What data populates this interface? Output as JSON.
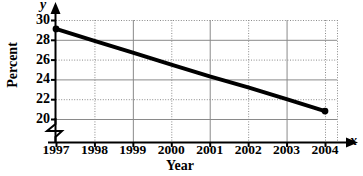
{
  "chart_data": {
    "type": "line",
    "title": "",
    "xlabel": "Year",
    "ylabel": "Percent",
    "x_axis_variable": "x",
    "y_axis_variable": "y",
    "categories": [
      "1997",
      "1998",
      "1999",
      "2000",
      "2001",
      "2002",
      "2003",
      "2004"
    ],
    "x": [
      1997,
      1998,
      1999,
      2000,
      2001,
      2002,
      2003,
      2004
    ],
    "values": [
      29.1,
      27.9,
      26.7,
      25.5,
      24.3,
      23.2,
      22.0,
      20.8
    ],
    "series": [
      {
        "name": "Percent",
        "values": [
          29.1,
          27.9,
          26.7,
          25.5,
          24.3,
          23.2,
          22.0,
          20.8
        ],
        "color": "#000000",
        "marker_endpoints_only": true
      }
    ],
    "ylim": [
      20,
      30
    ],
    "xlim": [
      1997,
      2004
    ],
    "ytick_labels": [
      "30",
      "28",
      "26",
      "24",
      "22",
      "20"
    ],
    "ytick_values": [
      30,
      28,
      26,
      24,
      22,
      20
    ],
    "grid": true,
    "grid_color": "#8a8a8a",
    "legend": false,
    "legend_position": "none",
    "y_axis_break": true,
    "annotations": []
  },
  "axis": {
    "y_variable_glyph": "y",
    "x_variable_glyph": "x",
    "y_title": "Percent",
    "x_title": "Year"
  },
  "colors": {
    "line": "#000000",
    "axis": "#000000",
    "grid": "#8a8a8a",
    "background": "#ffffff"
  }
}
